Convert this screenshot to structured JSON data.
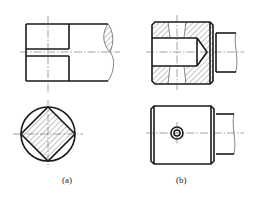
{
  "figure": {
    "type": "engineering-drawing",
    "views": [
      {
        "id": "a",
        "label": "(a)",
        "description": "Shaft end with slot: sectional front view and end view with square section in circle"
      },
      {
        "id": "b",
        "label": "(b)",
        "description": "Sleeve with drilled blind hole and cross hole: sectional front view and outside view"
      }
    ]
  },
  "labels": {
    "a": "(a)",
    "b": "(b)"
  },
  "colors": {
    "line": "#1a1a1a",
    "background": "#ffffff"
  }
}
